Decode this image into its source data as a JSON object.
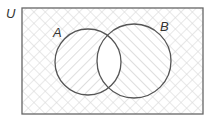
{
  "diagram": {
    "type": "venn",
    "universe_label": "U",
    "sets": [
      {
        "label": "A",
        "shading": "diagonal-forward"
      },
      {
        "label": "B",
        "shading": "diagonal-backward"
      }
    ],
    "intersection_shading": "none",
    "outside_shading": "cross-hatch",
    "colors": {
      "stroke": "#555555",
      "hatch": "#d4d4d4",
      "background": "#ffffff"
    }
  }
}
